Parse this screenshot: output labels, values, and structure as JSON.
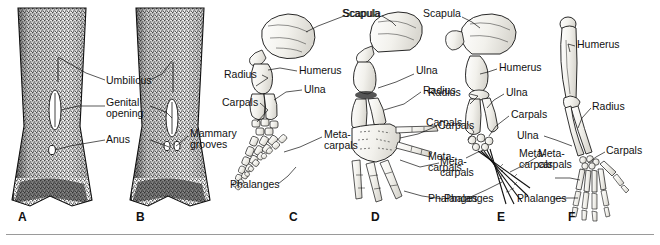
{
  "figure": {
    "background_color": "#ffffff",
    "ink_color": "#111111",
    "bone_fill_color": "#f6f5f1",
    "divider_color": "#9a9a9a"
  },
  "panels": [
    {
      "id": "A",
      "letter": "A",
      "letter_x": 18,
      "letter_y": 214,
      "type": "ventral-body-view",
      "description": "Stippled ventral view of female cetacean underside with tail flukes",
      "labels": [
        {
          "name": "umbilicus",
          "text": "Umbilicus",
          "x": 108,
          "y": 80,
          "align": "left"
        },
        {
          "name": "genital-opening",
          "text": "Genital opening",
          "x": 108,
          "y": 103,
          "align": "left",
          "wrap": true
        },
        {
          "name": "anus",
          "text": "Anus",
          "x": 108,
          "y": 138,
          "align": "left"
        }
      ]
    },
    {
      "id": "B",
      "letter": "B",
      "letter_x": 136,
      "letter_y": 214,
      "type": "ventral-body-view",
      "description": "Stippled ventral view of cetacean underside showing mammary grooves",
      "labels": [
        {
          "name": "mammary-grooves",
          "text": "Mammary grooves",
          "x": 190,
          "y": 132,
          "align": "left",
          "wrap": true
        }
      ]
    },
    {
      "id": "C",
      "letter": "C",
      "letter_x": 289,
      "letter_y": 214,
      "type": "forelimb-skeleton",
      "description": "Cetacean (whale) flipper skeleton with hyperphalangy",
      "labels": [
        {
          "name": "scapula",
          "text": "Scapula",
          "x": 307,
          "y": 10,
          "align": "left"
        },
        {
          "name": "humerus",
          "text": "Humerus",
          "x": 300,
          "y": 70,
          "align": "left"
        },
        {
          "name": "ulna",
          "text": "Ulna",
          "x": 305,
          "y": 88,
          "align": "left"
        },
        {
          "name": "radius",
          "text": "Radius",
          "x": 226,
          "y": 72,
          "align": "left"
        },
        {
          "name": "carpals",
          "text": "Carpals",
          "x": 224,
          "y": 100,
          "align": "left"
        },
        {
          "name": "metacarpals",
          "text": "Meta- carpals",
          "x": 325,
          "y": 133,
          "align": "left",
          "wrap": true
        },
        {
          "name": "phalanges",
          "text": "Phalanges",
          "x": 232,
          "y": 182,
          "align": "left"
        }
      ]
    },
    {
      "id": "D",
      "letter": "D",
      "letter_x": 371,
      "letter_y": 214,
      "type": "forelimb-skeleton",
      "description": "Pinniped (seal) fore-flipper skeleton",
      "labels": [
        {
          "name": "scapula",
          "text": "Scapula",
          "x": 345,
          "y": 10,
          "align": "left"
        },
        {
          "name": "ulna",
          "text": "Ulna",
          "x": 417,
          "y": 70,
          "align": "left"
        },
        {
          "name": "radius",
          "text": "Radius",
          "x": 424,
          "y": 88,
          "align": "left"
        },
        {
          "name": "carpals",
          "text": "Carpals",
          "x": 440,
          "y": 123,
          "align": "left"
        },
        {
          "name": "metacarpals",
          "text": "Meta- carpals",
          "x": 442,
          "y": 160,
          "align": "left",
          "wrap": true
        },
        {
          "name": "phalanges",
          "text": "Phalanges",
          "x": 446,
          "y": 196,
          "align": "left"
        }
      ]
    },
    {
      "id": "E",
      "letter": "E",
      "letter_x": 497,
      "letter_y": 214,
      "type": "forelimb-skeleton",
      "description": "Bat-like / flying vertebrate forelimb skeleton with elongated digits",
      "labels": [
        {
          "name": "scapula",
          "text": "Scapula",
          "x": 424,
          "y": 10,
          "align": "left"
        },
        {
          "name": "humerus",
          "text": "Humerus",
          "x": 500,
          "y": 65,
          "align": "left"
        },
        {
          "name": "ulna",
          "text": "Ulna",
          "x": 507,
          "y": 90,
          "align": "left"
        },
        {
          "name": "radius",
          "text": "Radius",
          "x": 430,
          "y": 90,
          "align": "left"
        },
        {
          "name": "carpals",
          "text": "Carpals",
          "x": 512,
          "y": 112,
          "align": "left"
        },
        {
          "name": "carpals_left",
          "text": "Carpals",
          "x": 428,
          "y": 120,
          "align": "left"
        },
        {
          "name": "metacarpals",
          "text": "Meta- carpals",
          "x": 430,
          "y": 155,
          "align": "left",
          "wrap": true
        },
        {
          "name": "metacarpals_right",
          "text": "Meta- carpals",
          "x": 540,
          "y": 152,
          "align": "left",
          "wrap": true
        },
        {
          "name": "phalanges",
          "text": "Phalanges",
          "x": 430,
          "y": 196,
          "align": "left"
        }
      ]
    },
    {
      "id": "F",
      "letter": "F",
      "letter_x": 568,
      "letter_y": 214,
      "type": "forelimb-skeleton",
      "description": "Human arm skeleton with five-digit hand",
      "labels": [
        {
          "name": "humerus",
          "text": "Humerus",
          "x": 578,
          "y": 42,
          "align": "left"
        },
        {
          "name": "radius",
          "text": "Radius",
          "x": 594,
          "y": 104,
          "align": "left"
        },
        {
          "name": "ulna",
          "text": "Ulna",
          "x": 518,
          "y": 133,
          "align": "left"
        },
        {
          "name": "carpals",
          "text": "Carpals",
          "x": 607,
          "y": 148,
          "align": "left"
        },
        {
          "name": "metacarpals",
          "text": "Meta- carpals",
          "x": 521,
          "y": 152,
          "align": "left",
          "wrap": true
        },
        {
          "name": "phalanges",
          "text": "Phalanges",
          "x": 519,
          "y": 196,
          "align": "left"
        }
      ]
    }
  ],
  "anatomical_terms": [
    "Umbilicus",
    "Genital opening",
    "Anus",
    "Mammary grooves",
    "Scapula",
    "Humerus",
    "Ulna",
    "Radius",
    "Carpals",
    "Metacarpals",
    "Phalanges"
  ]
}
